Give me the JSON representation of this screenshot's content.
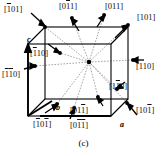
{
  "figure": {
    "caption": "(c)",
    "type": "crystallographic-unit-cell-directions"
  },
  "axes": [
    {
      "name": "a-axis",
      "label": "a"
    },
    {
      "name": "b-axis",
      "label": "b"
    },
    {
      "name": "c-axis",
      "label": "c"
    }
  ],
  "directions": [
    {
      "id": "d1",
      "name": "direction-1bar01",
      "text": "[101]",
      "bars": [
        1,
        0,
        0
      ],
      "x": 4,
      "y": 5
    },
    {
      "id": "d2",
      "name": "direction-01bar1",
      "text": "[011]",
      "bars": [
        0,
        1,
        0
      ],
      "x": 59,
      "y": 2
    },
    {
      "id": "d3",
      "name": "direction-011",
      "text": "[011]",
      "bars": [
        0,
        0,
        0
      ],
      "x": 105,
      "y": 2
    },
    {
      "id": "d4",
      "name": "direction-101",
      "text": "[101]",
      "bars": [
        0,
        0,
        0
      ],
      "x": 137,
      "y": 13
    },
    {
      "id": "d5",
      "name": "direction-1bar10",
      "text": "[110]",
      "bars": [
        1,
        0,
        0
      ],
      "x": 30,
      "y": 49
    },
    {
      "id": "d6",
      "name": "direction-110",
      "text": "[110]",
      "bars": [
        0,
        0,
        0
      ],
      "x": 136,
      "y": 62
    },
    {
      "id": "d7",
      "name": "direction-1bar1bar0",
      "text": "[110]",
      "bars": [
        1,
        1,
        0
      ],
      "x": 2,
      "y": 70
    },
    {
      "id": "d8",
      "name": "direction-11bar0",
      "text": "[110]",
      "bars": [
        0,
        1,
        0
      ],
      "x": 109,
      "y": 82
    },
    {
      "id": "d9",
      "name": "direction-011bar",
      "text": "[011]",
      "bars": [
        0,
        0,
        1
      ],
      "x": 70,
      "y": 106
    },
    {
      "id": "d10",
      "name": "direction-101bar",
      "text": "[101]",
      "bars": [
        0,
        0,
        1
      ],
      "x": 136,
      "y": 106
    },
    {
      "id": "d11",
      "name": "direction-1bar01bar",
      "text": "[101]",
      "bars": [
        1,
        0,
        1
      ],
      "x": 33,
      "y": 120
    },
    {
      "id": "d12",
      "name": "direction-01bar1bar",
      "text": "[011]",
      "bars": [
        0,
        1,
        1
      ],
      "x": 70,
      "y": 121
    }
  ],
  "axis_positions": {
    "a": {
      "x": 120,
      "y": 120
    },
    "b": {
      "x": 56,
      "y": 103
    },
    "c": {
      "x": 27,
      "y": 35
    }
  },
  "colors": {
    "line": "#000000",
    "dashed": "#555555",
    "background": "#ffffff",
    "text": "#111111"
  }
}
